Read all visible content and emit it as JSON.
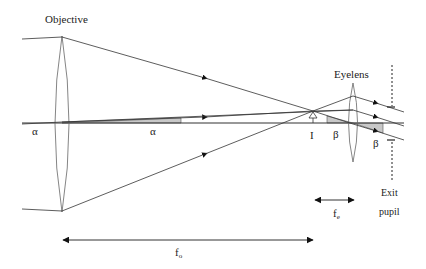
{
  "diagram": {
    "labels": {
      "objective": "Objective",
      "eyelens": "Eyelens",
      "alpha_left": "α",
      "alpha_mid": "α",
      "image": "I",
      "beta_mid": "β",
      "beta_right": "β",
      "exit_line1": "Exit",
      "exit_line2": "pupil",
      "fe_main": "f",
      "fe_sub": "e",
      "fo_main": "f",
      "fo_sub": "o"
    },
    "colors": {
      "line": "#333333",
      "lens": "#666666",
      "shade": "#c8c8c8",
      "background": "#ffffff"
    },
    "elements": {
      "objective_lens": {
        "x": 62,
        "top": 36,
        "bottom": 212
      },
      "eyelens": {
        "x": 353,
        "top": 83,
        "bottom": 162
      },
      "optical_axis_y": 123,
      "image_point": {
        "x": 313,
        "y": 112
      },
      "exit_pupil_x": 392,
      "focal_length_objective": {
        "x1": 62,
        "x2": 313,
        "y": 240
      },
      "focal_length_eyelens": {
        "x1": 313,
        "x2": 355,
        "y": 200
      }
    }
  }
}
